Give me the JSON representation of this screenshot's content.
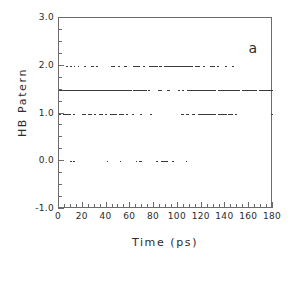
{
  "figure": {
    "panel_label": "a",
    "background": "#ffffff",
    "axis_color": "#6b6b6b",
    "data_color": "#3a3a3a"
  },
  "chart_data": {
    "type": "scatter",
    "title": "",
    "subtitle": "",
    "xlabel": "Time (ps)",
    "ylabel": "HB Patern",
    "xlim": [
      0,
      180
    ],
    "ylim": [
      -1.0,
      3.0
    ],
    "grid": false,
    "legend": null,
    "annotations": [
      {
        "text": "a",
        "x": 172,
        "y": 2.72
      }
    ],
    "xticks": [
      0,
      20,
      40,
      60,
      80,
      100,
      120,
      140,
      160,
      180
    ],
    "xtick_labels": [
      "0",
      "20",
      "40",
      "60",
      "80",
      "100",
      "120",
      "140",
      "160",
      "180"
    ],
    "xminor_step": 5,
    "yticks": [
      -1.0,
      0.0,
      1.0,
      2.0,
      3.0
    ],
    "ytick_labels": [
      "-1.0",
      "0.0",
      "1.0",
      "2.0",
      "3.0"
    ],
    "yminor_step": 0.25,
    "marker": "dot",
    "levels": [
      2.0,
      1.5,
      1.0,
      0.0
    ],
    "series": [
      {
        "name": "HB pattern 2.0",
        "y": 2.0,
        "segments": [
          [
            5.5,
            7.0
          ],
          [
            9.0,
            10.2
          ],
          [
            12.4,
            13.2
          ],
          [
            15.6,
            16.4
          ],
          [
            21.0,
            22.2
          ],
          [
            26.5,
            28.8
          ],
          [
            31.0,
            32.0
          ],
          [
            44.0,
            46.5
          ],
          [
            49.5,
            50.5
          ],
          [
            55.0,
            56.2
          ],
          [
            62.5,
            67.5
          ],
          [
            70.5,
            72.0
          ],
          [
            76.0,
            82.5
          ],
          [
            84.0,
            86.5
          ],
          [
            88.0,
            112.5
          ],
          [
            114.0,
            118.0
          ],
          [
            121.0,
            122.2
          ],
          [
            127.0,
            130.5
          ],
          [
            133.0,
            134.0
          ],
          [
            139.5,
            141.0
          ],
          [
            145.5,
            146.5
          ]
        ]
      },
      {
        "name": "HB pattern 1.5",
        "y": 1.5,
        "segments": [
          [
            0.0,
            60.5
          ],
          [
            62.0,
            73.5
          ],
          [
            75.0,
            76.2
          ],
          [
            83.5,
            86.0
          ],
          [
            90.5,
            92.5
          ],
          [
            100.5,
            101.5
          ],
          [
            103.5,
            105.0
          ],
          [
            107.5,
            131.5
          ],
          [
            133.5,
            152.0
          ],
          [
            154.0,
            166.0
          ],
          [
            168.0,
            180.0
          ]
        ]
      },
      {
        "name": "HB pattern 1.0",
        "y": 1.0,
        "segments": [
          [
            0.0,
            1.2
          ],
          [
            3.5,
            9.5
          ],
          [
            12.0,
            13.0
          ],
          [
            19.5,
            22.5
          ],
          [
            24.0,
            27.5
          ],
          [
            29.5,
            31.0
          ],
          [
            33.5,
            36.5
          ],
          [
            38.5,
            40.0
          ],
          [
            42.5,
            48.5
          ],
          [
            50.5,
            54.0
          ],
          [
            56.5,
            58.0
          ],
          [
            61.0,
            63.0
          ],
          [
            68.5,
            69.5
          ],
          [
            76.5,
            77.5
          ],
          [
            103.0,
            104.2
          ],
          [
            107.0,
            108.5
          ],
          [
            111.5,
            114.0
          ],
          [
            116.5,
            131.5
          ],
          [
            134.0,
            140.5
          ],
          [
            142.5,
            145.5
          ],
          [
            148.0,
            149.5
          ],
          [
            178.5,
            180.0
          ]
        ]
      },
      {
        "name": "HB pattern 0.0",
        "y": 0.0,
        "segments": [
          [
            9.5,
            10.5
          ],
          [
            12.0,
            13.0
          ],
          [
            40.0,
            41.0
          ],
          [
            51.0,
            52.0
          ],
          [
            64.5,
            65.5
          ],
          [
            67.0,
            69.5
          ],
          [
            82.0,
            83.0
          ],
          [
            85.5,
            91.5
          ],
          [
            95.0,
            96.5
          ],
          [
            106.5,
            107.5
          ]
        ]
      }
    ]
  }
}
